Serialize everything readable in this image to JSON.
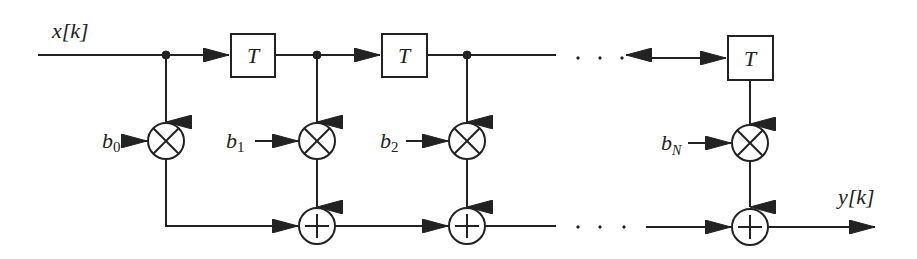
{
  "diagram": {
    "type": "FIR filter (tapped delay line) block diagram",
    "input_label": "x[k]",
    "output_label": "y[k]",
    "delay_label": "T",
    "coefficients": [
      {
        "base": "b",
        "sub": "0"
      },
      {
        "base": "b",
        "sub": "1"
      },
      {
        "base": "b",
        "sub": "2"
      },
      {
        "base": "b",
        "sub": "N"
      }
    ],
    "ellipsis": ". . .",
    "colors": {
      "stroke": "#222222",
      "background": "#ffffff"
    }
  }
}
